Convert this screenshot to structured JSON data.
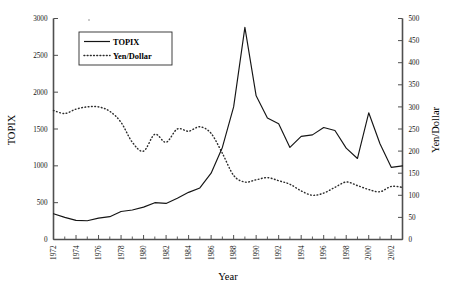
{
  "chart_data": {
    "type": "line",
    "title": "",
    "xlabel": "Year",
    "ylabel": "TOPIX",
    "y2label": "Yen/Dollar",
    "xlim": [
      1972,
      2003
    ],
    "ylim": [
      0,
      3000
    ],
    "y2lim": [
      0,
      500
    ],
    "grid": false,
    "legend_position": "upper-left-inside",
    "xticks_labeled": [
      "1972",
      "1974",
      "1976",
      "1978",
      "1980",
      "1982",
      "1984",
      "1986",
      "1988",
      "1990",
      "1992",
      "1994",
      "1996",
      "1998",
      "2000",
      "2002"
    ],
    "yticks_left": [
      "0",
      "500",
      "1000",
      "1500",
      "2000",
      "2500",
      "3000"
    ],
    "yticks_right": [
      "0",
      "50",
      "100",
      "150",
      "200",
      "250",
      "300",
      "350",
      "400",
      "450",
      "500"
    ],
    "x": [
      1972,
      1973,
      1974,
      1975,
      1976,
      1977,
      1978,
      1979,
      1980,
      1981,
      1982,
      1983,
      1984,
      1985,
      1986,
      1987,
      1988,
      1989,
      1990,
      1991,
      1992,
      1993,
      1994,
      1995,
      1996,
      1997,
      1998,
      1999,
      2000,
      2001,
      2002,
      2003
    ],
    "series": [
      {
        "name": "TOPIX",
        "axis": "left",
        "style": "solid",
        "values": [
          350,
          300,
          260,
          255,
          290,
          310,
          380,
          400,
          440,
          500,
          490,
          560,
          640,
          700,
          900,
          1250,
          1800,
          2880,
          1950,
          1650,
          1570,
          1250,
          1400,
          1420,
          1520,
          1480,
          1240,
          1100,
          1720,
          1300,
          980,
          1000
        ]
      },
      {
        "name": "Yen/Dollar",
        "axis": "right",
        "style": "dotted",
        "values": [
          292,
          285,
          295,
          300,
          300,
          290,
          265,
          220,
          200,
          238,
          220,
          250,
          245,
          255,
          240,
          195,
          145,
          130,
          135,
          140,
          133,
          125,
          110,
          100,
          105,
          118,
          130,
          122,
          113,
          108,
          120,
          118
        ]
      }
    ]
  },
  "legend": {
    "items": [
      {
        "label": "TOPIX",
        "style": "solid"
      },
      {
        "label": "Yen/Dollar",
        "style": "dotted"
      }
    ]
  },
  "axes": {
    "left_title": "TOPIX",
    "right_title": "Yen/Dollar",
    "bottom_title": "Year"
  },
  "colors": {
    "topix_line": "#151515",
    "yen_line": "#2b2b2b",
    "spine": "#4f4f4f",
    "background": "#ffffff"
  }
}
